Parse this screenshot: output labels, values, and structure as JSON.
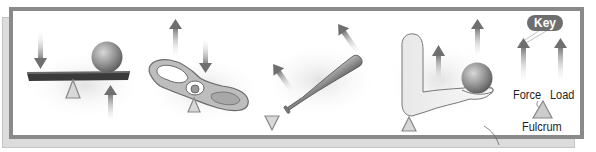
{
  "diagram": {
    "examples": [
      {
        "id": "seesaw",
        "name": "Seesaw lever"
      },
      {
        "id": "pull-tab",
        "name": "Can pull-tab"
      },
      {
        "id": "baseball-bat",
        "name": "Baseball bat"
      },
      {
        "id": "forearm",
        "name": "Forearm holding ball"
      }
    ],
    "key": {
      "title": "Key",
      "force_label": "Force",
      "load_label": "Load",
      "fulcrum_label": "Fulcrum"
    },
    "colors": {
      "frame": "#8a8a8a",
      "shadow_panel": "#dcdcdc",
      "arrow": "#777777",
      "fulcrum_fill": "#cccccc",
      "fulcrum_stroke": "#888888",
      "key_badge": "#6e6e6e"
    }
  }
}
